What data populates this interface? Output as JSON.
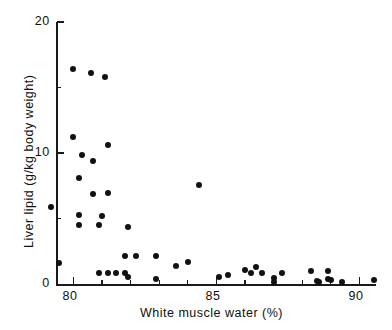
{
  "chart_data": {
    "type": "scatter",
    "title": "",
    "xlabel": "White muscle water (%)",
    "ylabel": "Liver lipid (g/kg body weight)",
    "xlim": [
      79.0,
      91.2
    ],
    "ylim": [
      0,
      20
    ],
    "xticks": [
      80,
      85,
      90
    ],
    "xticklabels": [
      "80",
      "85",
      "90"
    ],
    "xminorticks": [
      81,
      82,
      83,
      84,
      86,
      87,
      88,
      89,
      91
    ],
    "yticks": [
      0,
      10,
      20
    ],
    "yticklabels": [
      "0",
      "10",
      "20"
    ],
    "yminorticks": [
      5,
      15
    ],
    "grid": false,
    "legend": null,
    "marker": "filled-circle",
    "marker_color": "#111111",
    "marker_size": 6,
    "points": [
      {
        "x": 80.0,
        "y": 16.4
      },
      {
        "x": 80.6,
        "y": 16.1
      },
      {
        "x": 81.1,
        "y": 15.8
      },
      {
        "x": 80.0,
        "y": 11.2
      },
      {
        "x": 81.2,
        "y": 10.6
      },
      {
        "x": 80.3,
        "y": 9.9
      },
      {
        "x": 80.7,
        "y": 9.4
      },
      {
        "x": 80.2,
        "y": 8.1
      },
      {
        "x": 80.7,
        "y": 6.9
      },
      {
        "x": 81.2,
        "y": 7.0
      },
      {
        "x": 79.2,
        "y": 5.9
      },
      {
        "x": 80.2,
        "y": 5.3
      },
      {
        "x": 81.0,
        "y": 5.2
      },
      {
        "x": 80.2,
        "y": 4.5
      },
      {
        "x": 80.9,
        "y": 4.5
      },
      {
        "x": 81.9,
        "y": 4.4
      },
      {
        "x": 84.4,
        "y": 7.6
      },
      {
        "x": 79.5,
        "y": 1.6
      },
      {
        "x": 81.8,
        "y": 2.2
      },
      {
        "x": 82.2,
        "y": 2.2
      },
      {
        "x": 82.9,
        "y": 2.2
      },
      {
        "x": 83.6,
        "y": 1.4
      },
      {
        "x": 84.0,
        "y": 1.7
      },
      {
        "x": 80.9,
        "y": 0.85
      },
      {
        "x": 81.2,
        "y": 0.85
      },
      {
        "x": 81.5,
        "y": 0.9
      },
      {
        "x": 81.8,
        "y": 0.85
      },
      {
        "x": 81.9,
        "y": 0.6
      },
      {
        "x": 82.9,
        "y": 0.4
      },
      {
        "x": 85.1,
        "y": 0.6
      },
      {
        "x": 85.4,
        "y": 0.75
      },
      {
        "x": 86.0,
        "y": 1.1
      },
      {
        "x": 86.2,
        "y": 0.85
      },
      {
        "x": 86.4,
        "y": 1.3
      },
      {
        "x": 86.6,
        "y": 0.9
      },
      {
        "x": 87.0,
        "y": 0.45
      },
      {
        "x": 87.0,
        "y": 0.15
      },
      {
        "x": 87.3,
        "y": 0.85
      },
      {
        "x": 88.3,
        "y": 1.0
      },
      {
        "x": 88.5,
        "y": 0.25
      },
      {
        "x": 88.6,
        "y": 0.2
      },
      {
        "x": 88.9,
        "y": 1.0
      },
      {
        "x": 88.9,
        "y": 0.4
      },
      {
        "x": 89.0,
        "y": 0.35
      },
      {
        "x": 89.4,
        "y": 0.2
      },
      {
        "x": 90.5,
        "y": 0.35
      }
    ]
  }
}
